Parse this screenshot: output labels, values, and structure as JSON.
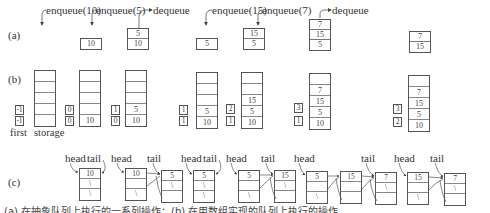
{
  "part_labels": {
    "a": "(a)",
    "b": "(b)",
    "c": "(c)"
  },
  "operations": [
    {
      "label": "enqueue(10)"
    },
    {
      "label": "enqueue(5)"
    },
    {
      "label": "dequeue"
    },
    {
      "label": "enqueue(15)"
    },
    {
      "label": "enqueue(7)"
    },
    {
      "label": "dequeue"
    }
  ],
  "abstract_queue_states": [
    {
      "items": []
    },
    {
      "items": [
        "10"
      ]
    },
    {
      "items": [
        "5",
        "10"
      ]
    },
    {
      "items": [
        "5"
      ]
    },
    {
      "items": [
        "15",
        "5"
      ]
    },
    {
      "items": [
        "7",
        "15",
        "5"
      ]
    },
    {
      "items": [
        "7",
        "15"
      ]
    }
  ],
  "array_states": [
    {
      "last": "-1",
      "first": "-1",
      "storage": [
        "",
        "",
        "",
        "",
        ""
      ]
    },
    {
      "last": "0",
      "first": "0",
      "storage": [
        "",
        "",
        "",
        "",
        "10"
      ]
    },
    {
      "last": "1",
      "first": "0",
      "storage": [
        "",
        "",
        "",
        "5",
        "10"
      ]
    },
    {
      "last": "1",
      "first": "1",
      "storage": [
        "",
        "",
        "",
        "5",
        "10"
      ]
    },
    {
      "last": "2",
      "first": "1",
      "storage": [
        "",
        "",
        "15",
        "5",
        "10"
      ]
    },
    {
      "last": "3",
      "first": "1",
      "storage": [
        "",
        "7",
        "15",
        "5",
        "10"
      ]
    },
    {
      "last": "3",
      "first": "2",
      "storage": [
        "",
        "7",
        "15",
        "5",
        "10"
      ]
    }
  ],
  "array_labels": {
    "first": "first",
    "storage": "storage"
  },
  "linked_list": {
    "head_label": "head",
    "tail_label": "tail",
    "null_symbol": "\\",
    "nodes": [
      "10",
      "10",
      "5",
      "5",
      "5",
      "15",
      "5",
      "15",
      "7",
      "15",
      "7"
    ]
  },
  "caption": "(a) 在抽象队列上执行的一系列操作；(b) 在用数组实现的队列上执行的操作"
}
